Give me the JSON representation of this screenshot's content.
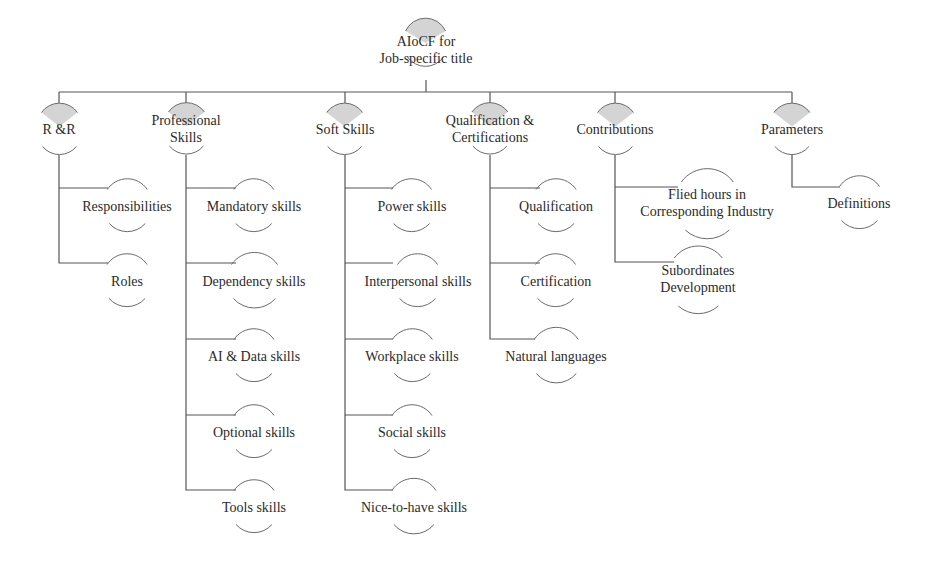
{
  "diagram": {
    "type": "tree",
    "colors": {
      "line": "#555555",
      "arc": "#6a6a6a",
      "arc_fill": "#d4d4d4",
      "text": "#2b2b2b"
    },
    "root": {
      "label_line1": "AIoCF for",
      "label_line2": "Job-specific title"
    },
    "categories": [
      {
        "label_line1": "R &R",
        "label_line2": "",
        "children": [
          {
            "label_line1": "Responsibilities",
            "label_line2": ""
          },
          {
            "label_line1": "Roles",
            "label_line2": ""
          }
        ]
      },
      {
        "label_line1": "Professional",
        "label_line2": "Skills",
        "children": [
          {
            "label_line1": "Mandatory  skills",
            "label_line2": ""
          },
          {
            "label_line1": "Dependency  skills",
            "label_line2": ""
          },
          {
            "label_line1": "AI & Data skills",
            "label_line2": ""
          },
          {
            "label_line1": "Optional  skills",
            "label_line2": ""
          },
          {
            "label_line1": "Tools skills",
            "label_line2": ""
          }
        ]
      },
      {
        "label_line1": "Soft Skills",
        "label_line2": "",
        "children": [
          {
            "label_line1": "Power skills",
            "label_line2": ""
          },
          {
            "label_line1": "Interpersonal  skills",
            "label_line2": ""
          },
          {
            "label_line1": "Workplace  skills",
            "label_line2": ""
          },
          {
            "label_line1": "Social  skills",
            "label_line2": ""
          },
          {
            "label_line1": "Nice-to-have  skills",
            "label_line2": ""
          }
        ]
      },
      {
        "label_line1": "Qualification &",
        "label_line2": "Certifications",
        "children": [
          {
            "label_line1": "Qualification",
            "label_line2": ""
          },
          {
            "label_line1": "Certification",
            "label_line2": ""
          },
          {
            "label_line1": "Natural languages",
            "label_line2": ""
          }
        ]
      },
      {
        "label_line1": "Contributions",
        "label_line2": "",
        "children": [
          {
            "label_line1": "Flied hours in",
            "label_line2": "Corresponding  Industry"
          },
          {
            "label_line1": "Subordinates",
            "label_line2": "Development"
          }
        ]
      },
      {
        "label_line1": "Parameters",
        "label_line2": "",
        "children": [
          {
            "label_line1": "Definitions",
            "label_line2": ""
          }
        ]
      }
    ]
  }
}
